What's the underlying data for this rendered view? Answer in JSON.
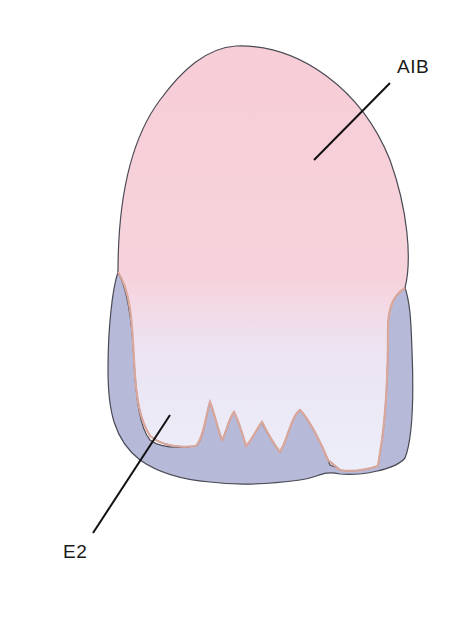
{
  "figure": {
    "type": "tooth-layering-diagram",
    "labels": [
      {
        "id": "aib",
        "text": "AIB"
      },
      {
        "id": "e2",
        "text": "E2"
      }
    ],
    "colors": {
      "top_layer_top": "#f7cfd8",
      "top_layer_mid": "#f6d6de",
      "top_layer_bottom": "#e8eaf8",
      "bottom_layer": "#b4b8d6",
      "outline": "#4a4a55",
      "edge_highlight": "#d9a79c",
      "leader_line": "#111111"
    }
  }
}
